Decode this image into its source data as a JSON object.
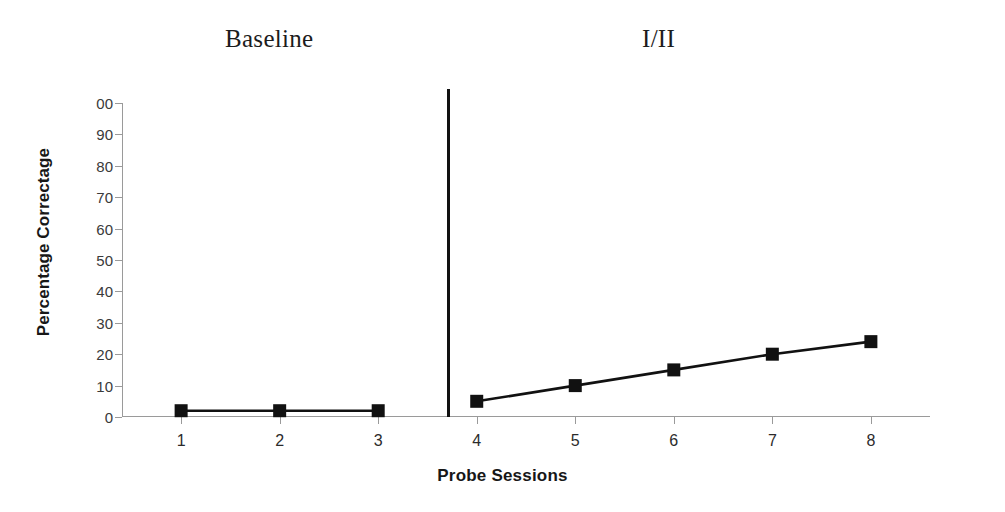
{
  "chart_data": {
    "type": "line",
    "title": "",
    "xlabel": "Probe Sessions",
    "ylabel": "Percentage Correctage",
    "xlim": [
      0.4,
      8.6
    ],
    "ylim": [
      0,
      100
    ],
    "ytick_labels": [
      "00",
      "90",
      "80",
      "70",
      "60",
      "50",
      "40",
      "30",
      "20",
      "10",
      "0"
    ],
    "ytick_values": [
      100,
      90,
      80,
      70,
      60,
      50,
      40,
      30,
      20,
      10,
      0
    ],
    "xtick_labels": [
      "1",
      "2",
      "3",
      "4",
      "5",
      "6",
      "7",
      "8"
    ],
    "x": [
      1,
      2,
      3,
      4,
      5,
      6,
      7,
      8
    ],
    "grid": false,
    "legend": "none",
    "marker": "filled-square",
    "line_color": "#111111",
    "marker_color": "#111111",
    "series": [
      {
        "name": "Baseline",
        "x": [
          1,
          2,
          3
        ],
        "values": [
          2,
          2,
          2
        ]
      },
      {
        "name": "I/II",
        "x": [
          4,
          5,
          6,
          7,
          8
        ],
        "values": [
          5,
          10,
          15,
          20,
          24
        ]
      }
    ],
    "phases": [
      {
        "label": "Baseline",
        "sessions": [
          1,
          2,
          3
        ]
      },
      {
        "label": "I/II",
        "sessions": [
          4,
          5,
          6,
          7,
          8
        ]
      }
    ],
    "phase_divider_at_x": 3.7,
    "annotations": []
  }
}
